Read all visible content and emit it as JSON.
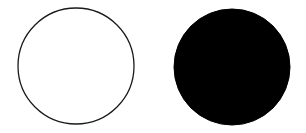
{
  "diagram": {
    "background": "#ffffff",
    "shapes": [
      {
        "type": "circle",
        "style": "outline",
        "cx": 76,
        "cy": 66,
        "r": 58,
        "stroke": "#1a1a1a",
        "fill": "#ffffff",
        "stroke_width": 1.3
      },
      {
        "type": "circle",
        "style": "filled",
        "cx": 232,
        "cy": 67,
        "r": 58,
        "stroke": "#000000",
        "fill": "#000000",
        "stroke_width": 1
      }
    ]
  }
}
